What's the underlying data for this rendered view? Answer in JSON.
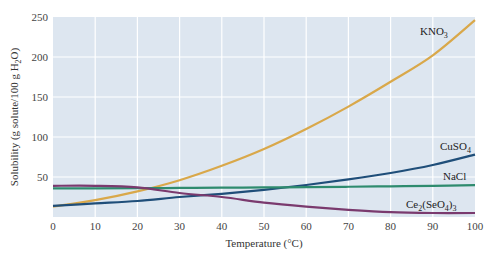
{
  "chart_data": {
    "type": "line",
    "title": "",
    "xlabel": "Temperature (°C)",
    "ylabel": "Solubility (g solute/100 g H2O)",
    "xlim": [
      0,
      100
    ],
    "ylim": [
      0,
      250
    ],
    "xticks": [
      0,
      10,
      20,
      30,
      40,
      50,
      60,
      70,
      80,
      90,
      100
    ],
    "yticks": [
      50,
      100,
      150,
      200,
      250
    ],
    "grid": true,
    "background": "#dde6f0",
    "x": [
      0,
      10,
      20,
      30,
      40,
      50,
      60,
      70,
      80,
      90,
      100
    ],
    "series": [
      {
        "name": "KNO3",
        "label_main": "KNO",
        "label_sub": "3",
        "color": "#d9a84a",
        "values": [
          13,
          21,
          32,
          46,
          64,
          85,
          110,
          138,
          169,
          202,
          246
        ]
      },
      {
        "name": "CuSO4",
        "label_main": "CuSO",
        "label_sub": "4",
        "color": "#1f4e79",
        "values": [
          14,
          17,
          20,
          25,
          29,
          34,
          40,
          47,
          55,
          65,
          78
        ]
      },
      {
        "name": "NaCl",
        "label_main": "NaCl",
        "label_sub": "",
        "color": "#2e8b6e",
        "values": [
          35.7,
          35.8,
          36.0,
          36.3,
          36.6,
          37.0,
          37.3,
          37.8,
          38.4,
          39.0,
          39.8
        ]
      },
      {
        "name": "Ce2(SeO4)3",
        "label_main": "Ce",
        "label_sub": "2",
        "label_rest": "(SeO",
        "label_sub2": "4",
        "label_end": ")",
        "label_sub3": "3",
        "color": "#7a3a6e",
        "values": [
          39,
          39,
          37,
          30,
          25,
          18,
          13,
          9,
          6,
          5,
          5
        ]
      }
    ]
  }
}
